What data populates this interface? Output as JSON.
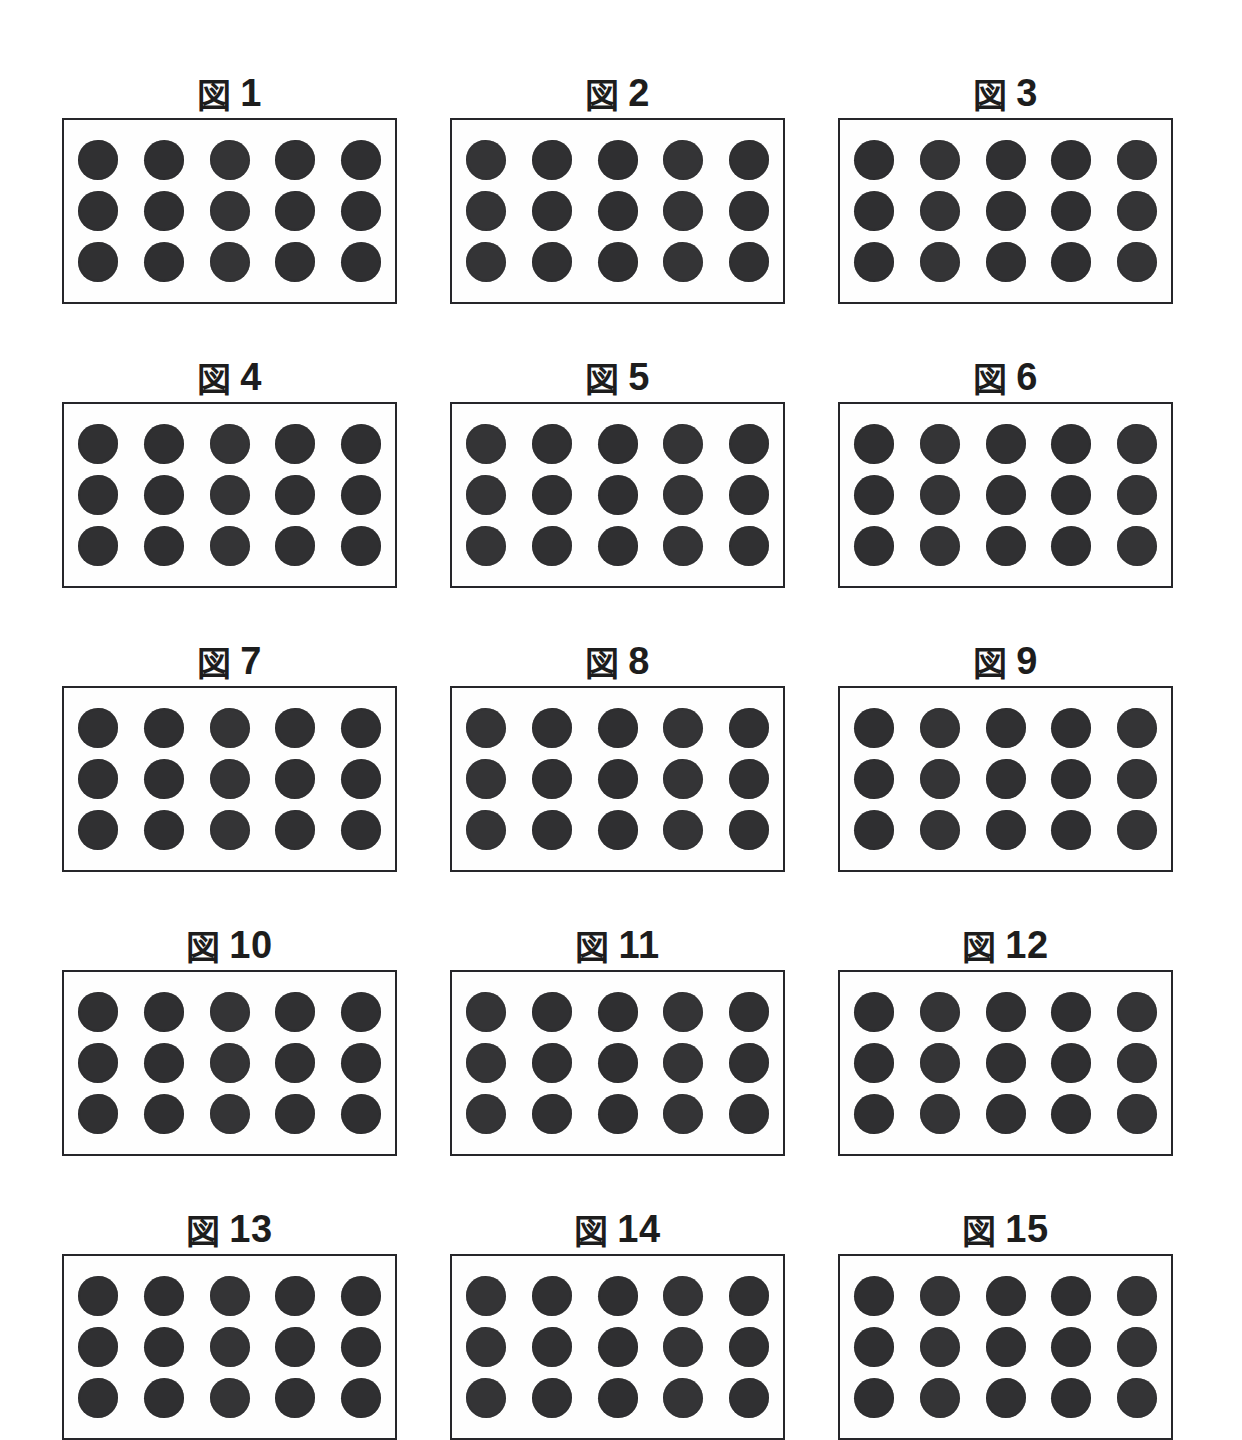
{
  "sheet": {
    "title": "図面",
    "page_background": "#ffffff",
    "figure_count": 15
  },
  "style": {
    "dot_color": "#323234",
    "border_color": "#26262a",
    "text_color": "#1d1d1d"
  },
  "caption_prefix": "図",
  "figures": [
    {
      "label": "図 1",
      "prefix": "図",
      "number": "1",
      "rows": 3,
      "cols": 5,
      "dot_count": 15
    },
    {
      "label": "図 2",
      "prefix": "図",
      "number": "2",
      "rows": 3,
      "cols": 5,
      "dot_count": 15
    },
    {
      "label": "図 3",
      "prefix": "図",
      "number": "3",
      "rows": 3,
      "cols": 5,
      "dot_count": 15
    },
    {
      "label": "図 4",
      "prefix": "図",
      "number": "4",
      "rows": 3,
      "cols": 5,
      "dot_count": 15
    },
    {
      "label": "図 5",
      "prefix": "図",
      "number": "5",
      "rows": 3,
      "cols": 5,
      "dot_count": 15
    },
    {
      "label": "図 6",
      "prefix": "図",
      "number": "6",
      "rows": 3,
      "cols": 5,
      "dot_count": 15
    },
    {
      "label": "図 7",
      "prefix": "図",
      "number": "7",
      "rows": 3,
      "cols": 5,
      "dot_count": 15
    },
    {
      "label": "図 8",
      "prefix": "図",
      "number": "8",
      "rows": 3,
      "cols": 5,
      "dot_count": 15
    },
    {
      "label": "図 9",
      "prefix": "図",
      "number": "9",
      "rows": 3,
      "cols": 5,
      "dot_count": 15
    },
    {
      "label": "図 10",
      "prefix": "図",
      "number": "10",
      "rows": 3,
      "cols": 5,
      "dot_count": 15
    },
    {
      "label": "図 11",
      "prefix": "図",
      "number": "11",
      "rows": 3,
      "cols": 5,
      "dot_count": 15
    },
    {
      "label": "図 12",
      "prefix": "図",
      "number": "12",
      "rows": 3,
      "cols": 5,
      "dot_count": 15
    },
    {
      "label": "図 13",
      "prefix": "図",
      "number": "13",
      "rows": 3,
      "cols": 5,
      "dot_count": 15
    },
    {
      "label": "図 14",
      "prefix": "図",
      "number": "14",
      "rows": 3,
      "cols": 5,
      "dot_count": 15
    },
    {
      "label": "図 15",
      "prefix": "図",
      "number": "15",
      "rows": 3,
      "cols": 5,
      "dot_count": 15
    }
  ]
}
